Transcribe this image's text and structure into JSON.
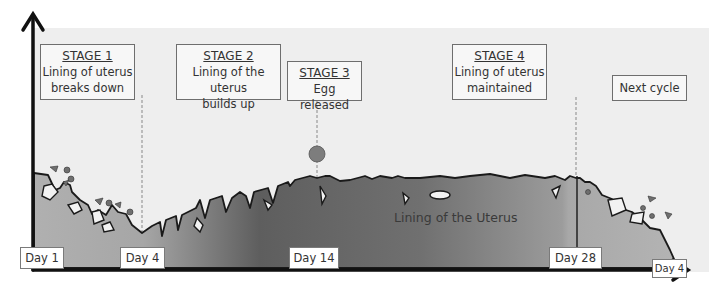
{
  "diagram": {
    "stages": [
      {
        "title": "STAGE 1",
        "line1": "Lining of uterus",
        "line2": "breaks down"
      },
      {
        "title": "STAGE 2",
        "line1": "Lining of the uterus",
        "line2": "builds up"
      },
      {
        "title": "STAGE 3",
        "line1": "Egg released",
        "line2": ""
      },
      {
        "title": "STAGE 4",
        "line1": "Lining of uterus",
        "line2": "maintained"
      }
    ],
    "next_cycle": "Next cycle",
    "lining_label": "Lining of the Uterus",
    "days": [
      "Day 1",
      "Day 4",
      "Day 14",
      "Day 28",
      "Day 4"
    ],
    "colors": {
      "background": "#eeeeee",
      "lining_dark": "#6a6a6a",
      "lining_light": "#a8a8a8",
      "egg": "#7d7d7d",
      "axis": "#111111"
    }
  }
}
